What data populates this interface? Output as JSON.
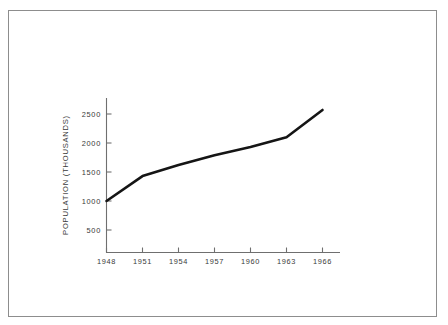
{
  "figure": {
    "background_color": "#ffffff",
    "frame_color": "#8d8d8d",
    "line_color": "#151515",
    "axis_color": "#6f6f6f",
    "text_color": "#3a3a3a"
  },
  "chart_data": {
    "type": "line",
    "title": "",
    "xlabel": "",
    "ylabel": "POPULATION (THOUSANDS)",
    "x": [
      1948,
      1951,
      1954,
      1957,
      1960,
      1963,
      1966
    ],
    "categories": [
      "1948",
      "1951",
      "1954",
      "1957",
      "1960",
      "1963",
      "1966"
    ],
    "values": [
      1000,
      1430,
      1620,
      1790,
      1930,
      2100,
      2570
    ],
    "series": [
      {
        "name": "Population",
        "values": [
          1000,
          1430,
          1620,
          1790,
          1930,
          2100,
          2570
        ]
      }
    ],
    "xlim": [
      1948,
      1966
    ],
    "ylim": [
      0,
      2800
    ],
    "ytick_labels": [
      "500",
      "1000",
      "1500",
      "2000",
      "2500"
    ],
    "ytick_values": [
      500,
      1000,
      1500,
      2000,
      2500
    ],
    "xtick_labels": [
      "1948",
      "1951",
      "1954",
      "1957",
      "1960",
      "1963",
      "1966"
    ],
    "xtick_values": [
      1948,
      1951,
      1954,
      1957,
      1960,
      1963,
      1966
    ],
    "grid": false,
    "legend": false,
    "legend_position": "none",
    "annotations": []
  }
}
